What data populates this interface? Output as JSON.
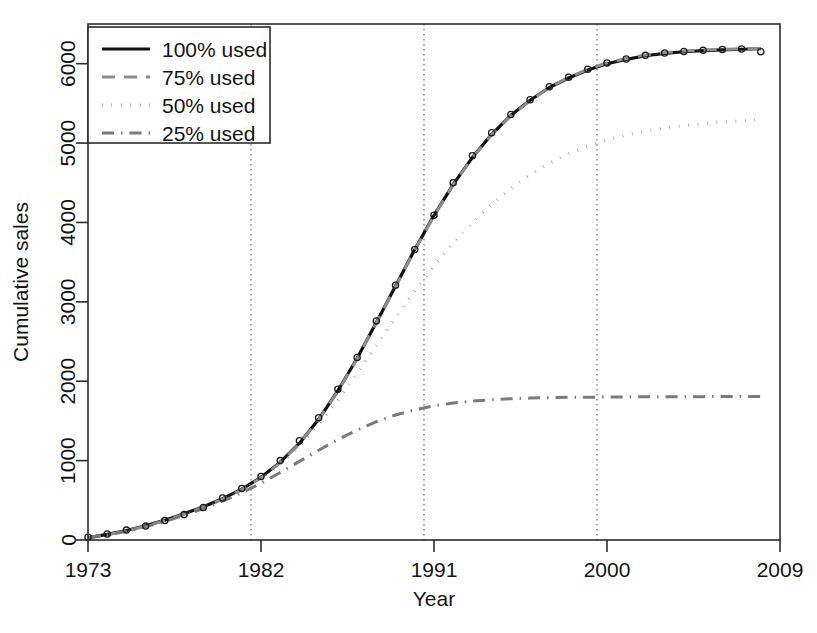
{
  "chart_data": {
    "type": "line",
    "title": "",
    "xlabel": "Year",
    "ylabel": "Cumulative sales",
    "xlim": [
      1973,
      2009
    ],
    "ylim": [
      0,
      6500
    ],
    "xticks": [
      1973,
      1982,
      1991,
      2000,
      2009
    ],
    "xtick_labels": [
      "1973",
      "1982",
      "1991",
      "2000",
      "2009"
    ],
    "yticks": [
      0,
      1000,
      2000,
      3000,
      4000,
      5000,
      6000
    ],
    "ytick_labels": [
      "0",
      "1000",
      "2000",
      "3000",
      "4000",
      "5000",
      "6000"
    ],
    "grid": "vertical dotted gridlines at 1982, 1991, 2000",
    "gridlines_x": [
      1982,
      1991,
      2000
    ],
    "legend_position": "top-left",
    "legend": [
      "100% used",
      "75% used",
      "50% used",
      "25% used"
    ],
    "series": [
      {
        "name": "100% used",
        "style": "solid",
        "color": "#111111",
        "width": 3.2,
        "x": [
          1973,
          1974,
          1975,
          1976,
          1977,
          1978,
          1979,
          1980,
          1981,
          1982,
          1983,
          1984,
          1985,
          1986,
          1987,
          1988,
          1989,
          1990,
          1991,
          1992,
          1993,
          1994,
          1995,
          1996,
          1997,
          1998,
          1999,
          2000,
          2001,
          2002,
          2003,
          2004,
          2005,
          2006,
          2007,
          2008
        ],
        "values": [
          30,
          70,
          120,
          180,
          250,
          330,
          420,
          520,
          640,
          790,
          980,
          1220,
          1520,
          1880,
          2290,
          2740,
          3200,
          3660,
          4090,
          4480,
          4820,
          5110,
          5350,
          5540,
          5700,
          5820,
          5920,
          6000,
          6055,
          6100,
          6130,
          6150,
          6165,
          6175,
          6182,
          6188
        ]
      },
      {
        "name": "75% used",
        "style": "dashed",
        "color": "#8c8c8c",
        "width": 3.0,
        "x": [
          1973,
          1974,
          1975,
          1976,
          1977,
          1978,
          1979,
          1980,
          1981,
          1982,
          1983,
          1984,
          1985,
          1986,
          1987,
          1988,
          1989,
          1990,
          1991,
          1992,
          1993,
          1994,
          1995,
          1996,
          1997,
          1998,
          1999,
          2000,
          2001,
          2002,
          2003,
          2004,
          2005,
          2006,
          2007,
          2008
        ],
        "values": [
          28,
          66,
          115,
          175,
          245,
          325,
          415,
          515,
          635,
          785,
          975,
          1215,
          1515,
          1875,
          2285,
          2735,
          3195,
          3655,
          4085,
          4475,
          4815,
          5105,
          5345,
          5535,
          5700,
          5825,
          5930,
          6010,
          6065,
          6110,
          6140,
          6160,
          6172,
          6180,
          6186,
          6192
        ]
      },
      {
        "name": "50% used",
        "style": "dotted",
        "color": "#6f6f6f",
        "width": 3.0,
        "x": [
          1973,
          1974,
          1975,
          1976,
          1977,
          1978,
          1979,
          1980,
          1981,
          1982,
          1983,
          1984,
          1985,
          1986,
          1987,
          1988,
          1989,
          1990,
          1991,
          1992,
          1993,
          1994,
          1995,
          1996,
          1997,
          1998,
          1999,
          2000,
          2001,
          2002,
          2003,
          2004,
          2005,
          2006,
          2007,
          2008
        ],
        "values": [
          28,
          66,
          115,
          175,
          245,
          325,
          415,
          515,
          630,
          775,
          955,
          1180,
          1450,
          1760,
          2100,
          2450,
          2800,
          3140,
          3450,
          3740,
          4000,
          4230,
          4430,
          4600,
          4745,
          4865,
          4960,
          5040,
          5100,
          5150,
          5190,
          5220,
          5245,
          5265,
          5280,
          5295
        ]
      },
      {
        "name": "25% used",
        "style": "dashdot",
        "color": "#7a7a7a",
        "width": 3.0,
        "x": [
          1973,
          1974,
          1975,
          1976,
          1977,
          1978,
          1979,
          1980,
          1981,
          1982,
          1983,
          1984,
          1985,
          1986,
          1987,
          1988,
          1989,
          1990,
          1991,
          1992,
          1993,
          1994,
          1995,
          1996,
          1997,
          1998,
          1999,
          2000,
          2001,
          2002,
          2003,
          2004,
          2005,
          2006,
          2007,
          2008
        ],
        "values": [
          28,
          64,
          110,
          168,
          235,
          310,
          395,
          490,
          595,
          715,
          850,
          990,
          1130,
          1265,
          1385,
          1490,
          1575,
          1640,
          1690,
          1725,
          1750,
          1768,
          1780,
          1788,
          1793,
          1797,
          1799,
          1801,
          1803,
          1804,
          1805,
          1806,
          1806,
          1807,
          1807,
          1808
        ]
      }
    ],
    "observed_points": {
      "name": "observed cumulative sales",
      "marker": "open-circle",
      "x": [
        1973,
        1974,
        1975,
        1976,
        1977,
        1978,
        1979,
        1980,
        1981,
        1982,
        1983,
        1984,
        1985,
        1986,
        1987,
        1988,
        1989,
        1990,
        1991,
        1992,
        1993,
        1994,
        1995,
        1996,
        1997,
        1998,
        1999,
        2000,
        2001,
        2002,
        2003,
        2004,
        2005,
        2006,
        2007,
        2008
      ],
      "values": [
        35,
        75,
        125,
        175,
        245,
        320,
        410,
        530,
        650,
        800,
        1000,
        1250,
        1540,
        1900,
        2300,
        2760,
        3210,
        3660,
        4090,
        4500,
        4840,
        5130,
        5360,
        5545,
        5710,
        5830,
        5930,
        6010,
        6060,
        6105,
        6135,
        6155,
        6168,
        6178,
        6185,
        6150
      ]
    }
  }
}
